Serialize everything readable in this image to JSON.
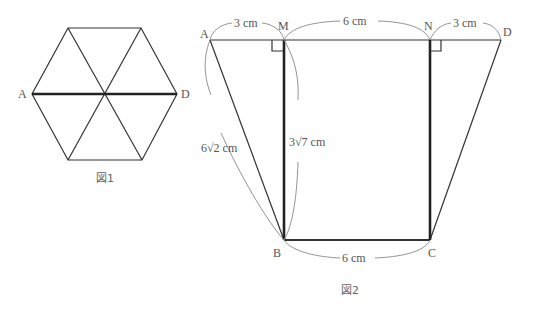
{
  "figure1": {
    "caption": "図1",
    "labels": {
      "left": "A",
      "right": "D"
    }
  },
  "figure2": {
    "caption": "図2",
    "points": {
      "A": "A",
      "M": "M",
      "N": "N",
      "D": "D",
      "B": "B",
      "C": "C"
    },
    "measures": {
      "AM": "3 cm",
      "MN": "6 cm",
      "ND": "3 cm",
      "BC": "6 cm",
      "AB": "6√2 cm",
      "MB": "3√7 cm"
    }
  },
  "colors": {
    "line": "#333333",
    "bold_line": "#222222",
    "label": "#555555",
    "bracket": "#888888"
  }
}
